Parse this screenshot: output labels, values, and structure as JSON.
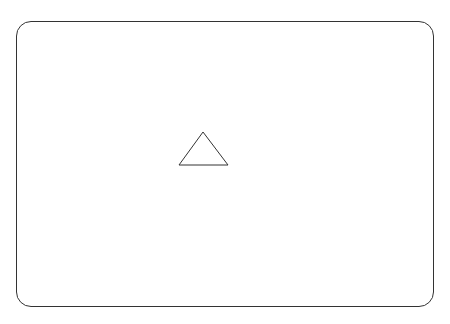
{
  "canvas": {
    "width": 450,
    "height": 324,
    "background": "#ffffff"
  },
  "frame": {
    "shape": "rounded-rectangle",
    "stroke": "#333333",
    "fill": "#ffffff"
  },
  "shapes": [
    {
      "icon": "triangle-icon",
      "type": "triangle",
      "fill": "#ffffff",
      "stroke": "#333333",
      "points": "203,132 179,165 228,165"
    }
  ]
}
